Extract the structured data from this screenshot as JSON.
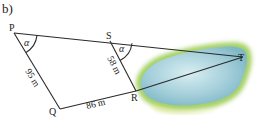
{
  "part_label": "b)",
  "points": {
    "P": {
      "label": "P",
      "x": 14,
      "y": 33
    },
    "S": {
      "label": "S",
      "x": 110,
      "y": 41
    },
    "T": {
      "label": "T",
      "x": 243,
      "y": 57
    },
    "Q": {
      "label": "Q",
      "x": 60,
      "y": 109
    },
    "R": {
      "label": "R",
      "x": 136,
      "y": 91
    }
  },
  "angles": {
    "at_P": "α",
    "at_S": "α"
  },
  "lengths": {
    "PQ": "95 m",
    "QR": "86 m",
    "SR": "58 m"
  },
  "colors": {
    "line": "#2a2a2a",
    "water": "#9cc9d6",
    "water_light": "#c8e3ea",
    "grass": "#8cc04a",
    "grass_light": "#d9e68a"
  }
}
